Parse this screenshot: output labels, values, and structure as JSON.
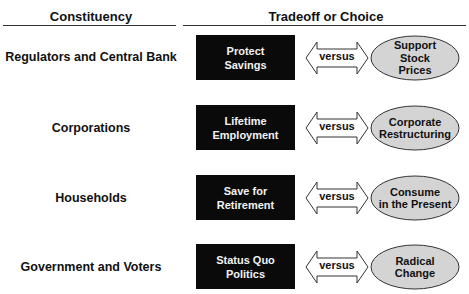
{
  "header": {
    "constituency": "Constituency",
    "tradeoff": "Tradeoff or Choice"
  },
  "connector_label": "versus",
  "colors": {
    "box_fill": "#0a0a0a",
    "box_text": "#f2f2f2",
    "ellipse_fill": "#d4d4d4",
    "outline": "#333333"
  },
  "rows": [
    {
      "constituency": "Regulators and Central Bank",
      "choice": [
        "Protect",
        "Savings"
      ],
      "versus": "versus",
      "alternative": [
        "Support",
        "Stock",
        "Prices"
      ]
    },
    {
      "constituency": "Corporations",
      "choice": [
        "Lifetime",
        "Employment"
      ],
      "versus": "versus",
      "alternative": [
        "Corporate",
        "Restructuring"
      ]
    },
    {
      "constituency": "Households",
      "choice": [
        "Save for",
        "Retirement"
      ],
      "versus": "versus",
      "alternative": [
        "Consume",
        "in the Present"
      ]
    },
    {
      "constituency": "Government and Voters",
      "choice": [
        "Status Quo",
        "Politics"
      ],
      "versus": "versus",
      "alternative": [
        "Radical",
        "Change"
      ]
    }
  ]
}
